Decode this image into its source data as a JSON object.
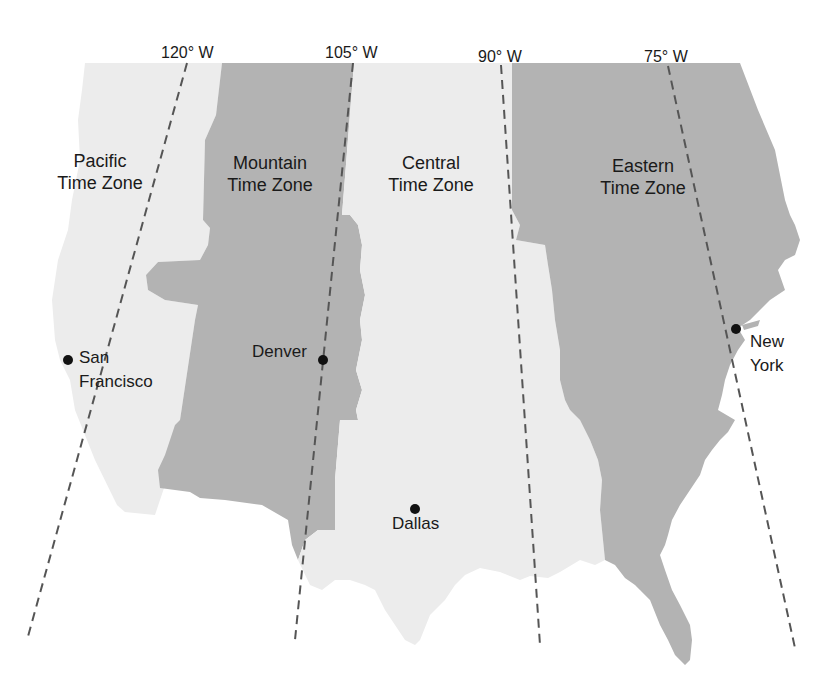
{
  "map": {
    "colors": {
      "light_zone": "#ececec",
      "dark_zone": "#b3b3b3",
      "meridian_line": "#555555",
      "background": "#ffffff",
      "city_dot": "#111111"
    },
    "meridians": [
      {
        "label": "120° W",
        "num": "120",
        "unit": "W"
      },
      {
        "label": "105° W",
        "num": "105",
        "unit": "W"
      },
      {
        "label": "90° W",
        "num": "90",
        "unit": "W"
      },
      {
        "label": "75° W",
        "num": "75",
        "unit": "W"
      }
    ],
    "zones": [
      {
        "name_line1": "Pacific",
        "name_line2": "Time Zone",
        "shade": "light"
      },
      {
        "name_line1": "Mountain",
        "name_line2": "Time Zone",
        "shade": "dark"
      },
      {
        "name_line1": "Central",
        "name_line2": "Time Zone",
        "shade": "light"
      },
      {
        "name_line1": "Eastern",
        "name_line2": "Time Zone",
        "shade": "dark"
      }
    ],
    "cities": [
      {
        "name_line1": "San",
        "name_line2": "Francisco"
      },
      {
        "name_line1": "Denver",
        "name_line2": ""
      },
      {
        "name_line1": "Dallas",
        "name_line2": ""
      },
      {
        "name_line1": "New",
        "name_line2": "York"
      }
    ]
  }
}
